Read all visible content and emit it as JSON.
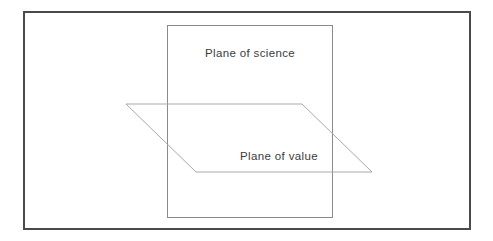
{
  "figure": {
    "background_color": "#ffffff",
    "width": 493,
    "height": 241,
    "outer_frame": {
      "name": "outer-frame",
      "stroke_color": "#4a4a4a",
      "stroke_width": 2,
      "x": 24,
      "y": 11,
      "width": 448,
      "height": 219
    },
    "vertical_plane": {
      "name": "plane-of-science",
      "label": "Plane of science",
      "stroke_color": "#8a8a8a",
      "stroke_width": 1,
      "x": 167,
      "y": 25,
      "width": 166,
      "height": 193,
      "label_x": 250,
      "label_y": 57
    },
    "horizontal_plane": {
      "name": "plane-of-value",
      "label": "Plane of value",
      "stroke_color": "#a8a8a8",
      "stroke_width": 1,
      "points": "126,104 302,104 372,172 196,172",
      "label_x": 279,
      "label_y": 160
    }
  }
}
